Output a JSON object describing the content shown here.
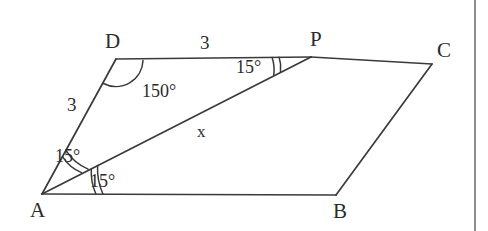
{
  "figure": {
    "shape_type": "parallelogram",
    "stroke_color": "#3a3a3a",
    "text_color": "#2b2b2b",
    "background_color": "#ffffff",
    "page_edge_color": "#8d8d8d"
  },
  "vertices": [
    {
      "name": "A",
      "label": "A",
      "x": 42,
      "y": 194
    },
    {
      "name": "B",
      "label": "B",
      "x": 336,
      "y": 195
    },
    {
      "name": "C",
      "label": "C",
      "x": 432,
      "y": 64
    },
    {
      "name": "D",
      "label": "D",
      "x": 116,
      "y": 59
    },
    {
      "name": "P",
      "label": "P",
      "x": 311,
      "y": 57
    }
  ],
  "vertex_labels": [
    {
      "name": "A",
      "text": "A",
      "x": 30,
      "y": 200
    },
    {
      "name": "B",
      "text": "B",
      "x": 333,
      "y": 201
    },
    {
      "name": "C",
      "text": "C",
      "x": 437,
      "y": 40
    },
    {
      "name": "D",
      "text": "D",
      "x": 105,
      "y": 31
    },
    {
      "name": "P",
      "text": "P",
      "x": 310,
      "y": 29
    }
  ],
  "segments": [
    {
      "name": "side-AD",
      "from": "A",
      "to": "D"
    },
    {
      "name": "side-DP",
      "from": "D",
      "to": "P"
    },
    {
      "name": "side-PC",
      "from": "P",
      "to": "C"
    },
    {
      "name": "side-CB",
      "from": "C",
      "to": "B"
    },
    {
      "name": "side-BA",
      "from": "B",
      "to": "A"
    },
    {
      "name": "diagonal-AP",
      "from": "A",
      "to": "P"
    }
  ],
  "measurements": [
    {
      "name": "length-AD",
      "text": "3",
      "x": 67,
      "y": 95
    },
    {
      "name": "length-DP",
      "text": "3",
      "x": 200,
      "y": 33
    },
    {
      "name": "length-AP",
      "text": "x",
      "x": 197,
      "y": 123
    }
  ],
  "angles": [
    {
      "name": "angle-ADP",
      "text": "150°",
      "x": 142,
      "y": 82,
      "value": 150,
      "vertex": "D",
      "arcs": 1
    },
    {
      "name": "angle-DAP",
      "text": "15°",
      "x": 55,
      "y": 147,
      "value": 15,
      "vertex": "A",
      "arcs": 2
    },
    {
      "name": "angle-PAB",
      "text": "15°",
      "x": 90,
      "y": 172,
      "value": 15,
      "vertex": "A",
      "arcs": 2
    },
    {
      "name": "angle-APD",
      "text": "15°",
      "x": 236,
      "y": 58,
      "value": 15,
      "vertex": "P",
      "arcs": 2
    }
  ],
  "page_edge": {
    "name": "page-edge",
    "x": 474
  }
}
